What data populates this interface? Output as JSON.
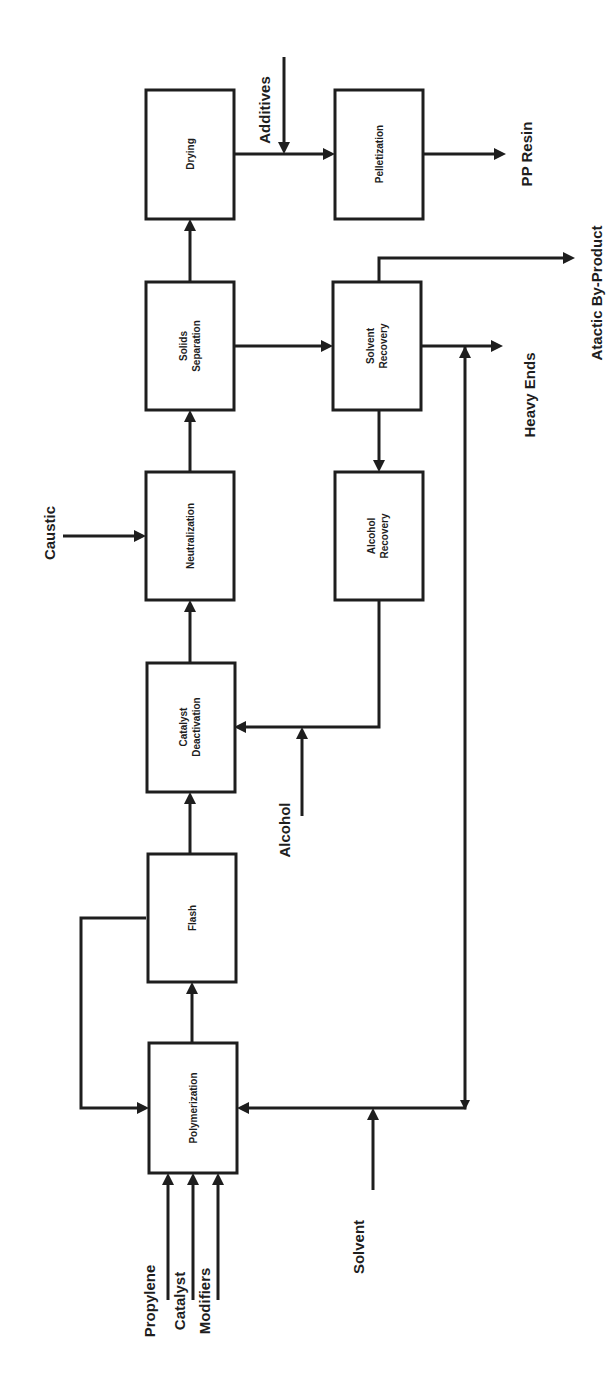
{
  "diagram": {
    "orientation": "rotated 90 degrees counter-clockwise",
    "colors": {
      "line": "#1e1e1e",
      "background": "#ffffff"
    },
    "units": {
      "drying": {
        "label": "Drying"
      },
      "pelletization": {
        "label": "Pelletization"
      },
      "solids_separation": {
        "line1": "Solids",
        "line2": "Separation"
      },
      "solvent_recovery": {
        "line1": "Solvent",
        "line2": "Recovery"
      },
      "neutralization": {
        "label": "Neutralization"
      },
      "alcohol_recovery": {
        "line1": "Alcohol",
        "line2": "Recovery"
      },
      "catalyst_deactivation": {
        "line1": "Catalyst",
        "line2": "Deactivation"
      },
      "flash": {
        "label": "Flash"
      },
      "polymerization": {
        "label": "Polymerization"
      }
    },
    "streams": {
      "additives": "Additives",
      "pp_resin": "PP Resin",
      "atactic": "Atactic By-Product",
      "heavy_ends": "Heavy Ends",
      "caustic": "Caustic",
      "alcohol": "Alcohol",
      "solvent": "Solvent",
      "propylene": "Propylene",
      "catalyst": "Catalyst",
      "modifiers": "Modifiers"
    }
  }
}
